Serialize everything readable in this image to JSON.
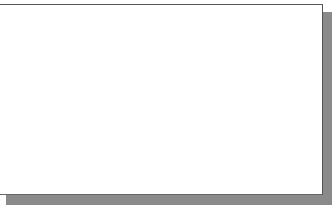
{
  "drawing": {
    "description": "Circle with two tangent lines meeting at an external point on a grid",
    "colors": {
      "background": "#ffffff",
      "grid": "#d6d6d6",
      "geometry": "#3a3a3a",
      "border": "#555555",
      "shadow": "#8a8a8a",
      "vertical_line": "#555555"
    },
    "grid": {
      "vertical_x": [
        18,
        46,
        75,
        104,
        133,
        161,
        190,
        218,
        275,
        303
      ],
      "horizontal_y": [
        32,
        60,
        89,
        117,
        146,
        174
      ]
    },
    "circle": {
      "cx": 88,
      "cy": 108,
      "r": 74
    },
    "center_point": {
      "x": 88,
      "y": 108
    },
    "external_point": {
      "x": 313,
      "y": 60
    },
    "tangent_points": [
      {
        "x": 104,
        "y": 34
      },
      {
        "x": 137,
        "y": 166
      }
    ],
    "vertical_line_x": 245
  }
}
